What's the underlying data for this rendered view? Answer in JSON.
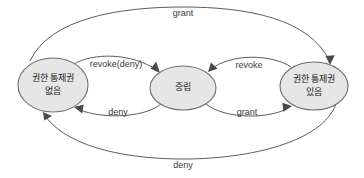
{
  "diagram": {
    "type": "state-transition-diagram",
    "background_color": "#ffffff",
    "node_fill_color": "#e6e6e6",
    "node_stroke_color": "#6f6f6f",
    "edge_color": "#5c5c5c",
    "states": [
      {
        "id": "no-control",
        "label_line1": "권한 통제권",
        "label_line2": "없음",
        "cx": 53,
        "cy": 85,
        "rx": 35,
        "ry": 27
      },
      {
        "id": "neutral",
        "label_line1": "중립",
        "label_line2": "",
        "cx": 183,
        "cy": 88,
        "rx": 33,
        "ry": 22
      },
      {
        "id": "has-control",
        "label_line1": "권한 통제권",
        "label_line2": "있음",
        "cx": 314,
        "cy": 86,
        "rx": 34,
        "ry": 24
      }
    ],
    "transitions": [
      {
        "id": "grant-outer-top",
        "label": "grant",
        "from": "no-control",
        "to": "has-control",
        "label_x": 183,
        "label_y": 14
      },
      {
        "id": "revoke-deny-inner-upper",
        "label": "revoke(deny)",
        "from": "no-control",
        "to": "neutral",
        "label_x": 116,
        "label_y": 65
      },
      {
        "id": "deny-inner-lower",
        "label": "deny",
        "from": "neutral",
        "to": "no-control",
        "label_x": 118,
        "label_y": 113
      },
      {
        "id": "revoke-inner-upper",
        "label": "revoke",
        "from": "has-control",
        "to": "neutral",
        "label_x": 249,
        "label_y": 66
      },
      {
        "id": "grant-inner-lower",
        "label": "grant",
        "from": "neutral",
        "to": "has-control",
        "label_x": 247,
        "label_y": 113
      },
      {
        "id": "deny-outer-bottom",
        "label": "deny",
        "from": "has-control",
        "to": "no-control",
        "label_x": 183,
        "label_y": 166
      }
    ]
  }
}
